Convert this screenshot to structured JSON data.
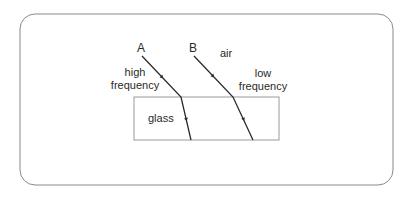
{
  "diagram": {
    "type": "refraction",
    "labels": {
      "ray_a": "A",
      "ray_b": "B",
      "medium_top": "air",
      "medium_bottom": "glass",
      "ray_a_desc_line1": "high",
      "ray_a_desc_line2": "frequency",
      "ray_b_desc_line1": "low",
      "ray_b_desc_line2": "frequency"
    },
    "colors": {
      "line": "#2a2a2a",
      "border": "#8a8a8a",
      "glass_border": "#9a9a9a"
    }
  }
}
